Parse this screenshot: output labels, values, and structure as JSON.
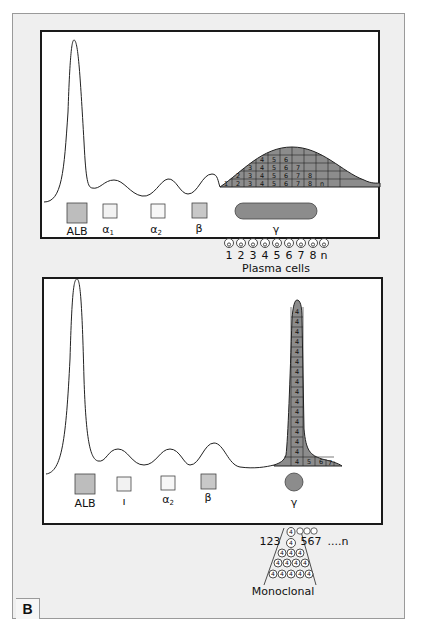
{
  "figure_label": "B",
  "colors": {
    "fill_dark": "#8c8c8c",
    "fill_light": "#bdbdbd",
    "fill_pale": "#f2f2f2",
    "line": "#222222",
    "panel_bg": "#ffffff",
    "frame_bg": "#efefef"
  },
  "top_panel": {
    "title": "Polyclonal",
    "fractions": [
      {
        "name": "ALB",
        "label": "ALB"
      },
      {
        "name": "alpha1",
        "label": "α",
        "sub": "1"
      },
      {
        "name": "alpha2",
        "label": "α",
        "sub": "2"
      },
      {
        "name": "beta",
        "label": "β"
      },
      {
        "name": "gamma",
        "label": "γ"
      }
    ],
    "gamma_grid_rows": [
      [
        "1",
        "2",
        "3",
        "4",
        "5",
        "6",
        "7",
        "8",
        "n"
      ],
      [
        "2",
        "3",
        "4",
        "5",
        "6",
        "7",
        "8"
      ],
      [
        "3",
        "4",
        "5",
        "6",
        "7"
      ],
      [
        "4",
        "5",
        "6"
      ]
    ],
    "cell_numbers": [
      "1",
      "2",
      "3",
      "4",
      "5",
      "6",
      "7",
      "8",
      "n"
    ],
    "cells_caption": "Plasma cells"
  },
  "bottom_panel": {
    "fractions": [
      {
        "name": "ALB",
        "label": "ALB"
      },
      {
        "name": "alpha1",
        "label": "ı"
      },
      {
        "name": "alpha2",
        "label": "α",
        "sub": "2"
      },
      {
        "name": "beta",
        "label": "β"
      },
      {
        "name": "gamma",
        "label": "γ"
      }
    ],
    "spike_column_value": "4",
    "spike_column_count": 15,
    "spike_base_row": [
      "4",
      "5",
      "6",
      "7"
    ],
    "pyramid_left_label": "123",
    "pyramid_right_label": "567",
    "pyramid_tail_label": "....n",
    "pyramid_cell_value": "4",
    "pyramid_rows": [
      1,
      1,
      3,
      4,
      5
    ],
    "caption": "Monoclonal"
  }
}
